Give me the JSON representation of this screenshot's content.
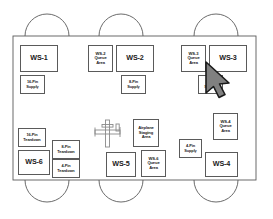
{
  "diagram": {
    "colors": {
      "line": "#5a5a5a",
      "fill": "#ffffff",
      "text": "#1a1a1a",
      "cursor_fill": "#808080",
      "cursor_stroke": "#1a1a1a"
    },
    "bays": {
      "top_count": 3,
      "bottom_count": 3,
      "shape": "semicircular-arc"
    },
    "airplane_symbol": {
      "name": "airplane-staging-symbol",
      "description": "cross-shaped airplane plan outline"
    },
    "boxes": [
      {
        "id": "ws-1",
        "label": "WS-1",
        "style": "ws",
        "x": 20,
        "y": 45,
        "w": 38,
        "h": 27
      },
      {
        "id": "ws-2-queue-area",
        "label": "WS-2\nQueue\nArea",
        "style": "small",
        "x": 88,
        "y": 45,
        "w": 25,
        "h": 27
      },
      {
        "id": "ws-2",
        "label": "WS-2",
        "style": "ws",
        "x": 116,
        "y": 45,
        "w": 38,
        "h": 27
      },
      {
        "id": "ws-3-queue-area",
        "label": "WS-3\nQueue\nArea",
        "style": "small",
        "x": 181,
        "y": 45,
        "w": 25,
        "h": 27
      },
      {
        "id": "ws-3",
        "label": "WS-3",
        "style": "ws",
        "x": 209,
        "y": 45,
        "w": 38,
        "h": 27
      },
      {
        "id": "16-pin-supply",
        "label": "16-Pin\nSupply",
        "style": "tiny",
        "x": 20,
        "y": 75,
        "w": 25,
        "h": 19
      },
      {
        "id": "8-pin-supply-top",
        "label": "8-Pin\nSupply",
        "style": "tiny",
        "x": 121,
        "y": 75,
        "w": 25,
        "h": 19
      },
      {
        "id": "8-pin-supply-right",
        "label": "8-Pin\nSupply",
        "style": "tiny",
        "x": 198,
        "y": 75,
        "w": 25,
        "h": 19
      },
      {
        "id": "ws-4-queue-area",
        "label": "WS-4\nQueue\nArea",
        "style": "small",
        "x": 213,
        "y": 113,
        "w": 25,
        "h": 27
      },
      {
        "id": "airplane-staging",
        "label": "Airplane\nStaging\nArea",
        "style": "small",
        "x": 133,
        "y": 119,
        "w": 26,
        "h": 28
      },
      {
        "id": "16-pin-teardown",
        "label": "16-Pin\nTeardown",
        "style": "tiny",
        "x": 18,
        "y": 128,
        "w": 28,
        "h": 19
      },
      {
        "id": "8-pin-teardown",
        "label": "8-Pin\nTeardown",
        "style": "tiny",
        "x": 52,
        "y": 140,
        "w": 28,
        "h": 19
      },
      {
        "id": "4-pin-supply",
        "label": "4-Pin\nSupply",
        "style": "tiny",
        "x": 179,
        "y": 139,
        "w": 23,
        "h": 19
      },
      {
        "id": "4-pin-teardown",
        "label": "4-Pin\nTeardown",
        "style": "tiny",
        "x": 52,
        "y": 159,
        "w": 28,
        "h": 19
      },
      {
        "id": "ws-6",
        "label": "WS-6",
        "style": "ws",
        "x": 18,
        "y": 150,
        "w": 32,
        "h": 25
      },
      {
        "id": "ws-5",
        "label": "WS-5",
        "style": "ws",
        "x": 106,
        "y": 152,
        "w": 30,
        "h": 25
      },
      {
        "id": "ws-6-queue-area",
        "label": "WS-6\nQueue\nArea",
        "style": "small",
        "x": 141,
        "y": 150,
        "w": 25,
        "h": 27
      },
      {
        "id": "ws-4",
        "label": "WS-4",
        "style": "ws",
        "x": 205,
        "y": 152,
        "w": 33,
        "h": 25
      }
    ],
    "floor_outline": {
      "x": 13,
      "y": 36,
      "w": 243,
      "h": 144
    }
  }
}
